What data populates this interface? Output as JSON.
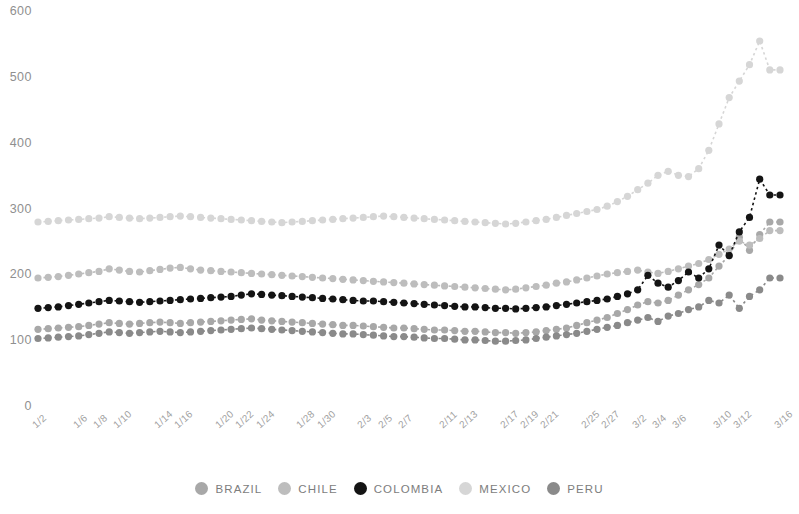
{
  "chart_data": {
    "type": "line",
    "title": "",
    "subtitle": "",
    "xlabel": "",
    "ylabel": "",
    "ylim": [
      0,
      600
    ],
    "yticks": [
      0,
      100,
      200,
      300,
      400,
      500,
      600
    ],
    "grid": false,
    "legend_position": "bottom",
    "marker": "circle-dotted",
    "x_tick_labels": [
      "1/2",
      "1/6",
      "1/8",
      "1/10",
      "1/14",
      "1/16",
      "1/20",
      "1/22",
      "1/24",
      "1/28",
      "1/30",
      "2/3",
      "2/5",
      "2/7",
      "2/11",
      "2/13",
      "2/17",
      "2/19",
      "2/21",
      "2/25",
      "2/27",
      "3/2",
      "3/4",
      "3/6",
      "3/10",
      "3/12",
      "3/16"
    ],
    "x": [
      "1/2",
      "1/3",
      "1/4",
      "1/5",
      "1/6",
      "1/7",
      "1/8",
      "1/9",
      "1/10",
      "1/11",
      "1/12",
      "1/13",
      "1/14",
      "1/15",
      "1/16",
      "1/17",
      "1/18",
      "1/19",
      "1/20",
      "1/21",
      "1/22",
      "1/23",
      "1/24",
      "1/25",
      "1/26",
      "1/27",
      "1/28",
      "1/29",
      "1/30",
      "1/31",
      "2/1",
      "2/2",
      "2/3",
      "2/4",
      "2/5",
      "2/6",
      "2/7",
      "2/8",
      "2/9",
      "2/10",
      "2/11",
      "2/12",
      "2/13",
      "2/14",
      "2/15",
      "2/16",
      "2/17",
      "2/18",
      "2/19",
      "2/20",
      "2/21",
      "2/22",
      "2/23",
      "2/24",
      "2/25",
      "2/26",
      "2/27",
      "2/28",
      "3/1",
      "3/2",
      "3/3",
      "3/4",
      "3/5",
      "3/6",
      "3/7",
      "3/8",
      "3/9",
      "3/10",
      "3/11",
      "3/12",
      "3/13",
      "3/14",
      "3/15",
      "3/16"
    ],
    "series": [
      {
        "name": "BRAZIL",
        "color": "#a8a8a8",
        "values": [
          118,
          119,
          120,
          121,
          122,
          124,
          126,
          128,
          127,
          126,
          127,
          128,
          129,
          128,
          127,
          128,
          129,
          130,
          131,
          132,
          133,
          134,
          132,
          131,
          130,
          129,
          128,
          127,
          126,
          125,
          124,
          124,
          123,
          122,
          121,
          120,
          120,
          119,
          118,
          117,
          117,
          116,
          115,
          115,
          114,
          113,
          113,
          112,
          113,
          114,
          116,
          118,
          120,
          124,
          128,
          132,
          136,
          142,
          148,
          155,
          160,
          158,
          162,
          170,
          178,
          186,
          196,
          214,
          230,
          258,
          238,
          262,
          281,
          281
        ]
      },
      {
        "name": "CHILE",
        "color": "#bdbdbd",
        "values": [
          196,
          197,
          198,
          200,
          202,
          204,
          206,
          210,
          208,
          206,
          205,
          207,
          209,
          211,
          212,
          210,
          208,
          207,
          206,
          205,
          204,
          203,
          202,
          201,
          200,
          199,
          198,
          197,
          196,
          195,
          194,
          193,
          192,
          191,
          190,
          189,
          188,
          187,
          186,
          185,
          184,
          183,
          182,
          181,
          180,
          179,
          178,
          179,
          181,
          183,
          185,
          188,
          190,
          193,
          196,
          199,
          202,
          204,
          206,
          208,
          205,
          203,
          206,
          210,
          214,
          218,
          224,
          232,
          240,
          252,
          246,
          256,
          268,
          268
        ]
      },
      {
        "name": "COLOMBIA",
        "color": "#141414",
        "values": [
          150,
          151,
          152,
          154,
          156,
          158,
          160,
          162,
          161,
          160,
          159,
          160,
          161,
          162,
          163,
          164,
          165,
          166,
          167,
          168,
          170,
          172,
          171,
          170,
          169,
          168,
          167,
          166,
          165,
          164,
          163,
          162,
          161,
          161,
          160,
          159,
          158,
          157,
          156,
          155,
          154,
          153,
          152,
          152,
          151,
          150,
          150,
          149,
          150,
          151,
          152,
          154,
          156,
          158,
          160,
          162,
          164,
          168,
          172,
          178,
          200,
          188,
          182,
          192,
          205,
          196,
          210,
          246,
          230,
          266,
          288,
          346,
          322,
          322
        ]
      },
      {
        "name": "MEXICO",
        "color": "#d6d6d6",
        "values": [
          281,
          282,
          283,
          284,
          285,
          286,
          287,
          289,
          288,
          287,
          286,
          287,
          288,
          289,
          290,
          289,
          288,
          287,
          286,
          285,
          284,
          283,
          282,
          281,
          280,
          281,
          282,
          283,
          284,
          285,
          286,
          287,
          288,
          289,
          290,
          289,
          288,
          287,
          286,
          285,
          284,
          283,
          282,
          281,
          280,
          279,
          278,
          279,
          281,
          283,
          285,
          288,
          291,
          294,
          297,
          300,
          305,
          312,
          320,
          330,
          340,
          352,
          358,
          352,
          350,
          362,
          390,
          430,
          470,
          495,
          520,
          556,
          512,
          512
        ]
      },
      {
        "name": "PERU",
        "color": "#8a8a8a",
        "values": [
          104,
          105,
          106,
          107,
          108,
          110,
          112,
          114,
          113,
          112,
          113,
          114,
          115,
          114,
          113,
          114,
          115,
          116,
          117,
          118,
          119,
          120,
          119,
          118,
          117,
          116,
          115,
          114,
          113,
          112,
          111,
          111,
          110,
          109,
          108,
          107,
          107,
          106,
          105,
          104,
          104,
          103,
          102,
          102,
          101,
          100,
          100,
          101,
          102,
          104,
          106,
          108,
          110,
          112,
          115,
          118,
          121,
          124,
          128,
          132,
          136,
          130,
          138,
          142,
          148,
          152,
          162,
          158,
          170,
          150,
          168,
          178,
          196,
          196
        ]
      }
    ]
  },
  "legend": {
    "items": [
      {
        "label": "BRAZIL",
        "color": "#a8a8a8"
      },
      {
        "label": "CHILE",
        "color": "#bdbdbd"
      },
      {
        "label": "COLOMBIA",
        "color": "#141414"
      },
      {
        "label": "MEXICO",
        "color": "#d6d6d6"
      },
      {
        "label": "PERU",
        "color": "#8a8a8a"
      }
    ]
  },
  "axis": {
    "y_tick_color": "#8f8f8f",
    "x_tick_color": "#a0a0a0"
  }
}
